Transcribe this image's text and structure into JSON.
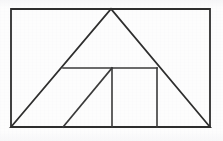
{
  "figure": {
    "background_color": "#fdfdfd",
    "stroke_color": "#2e2e2e",
    "stroke_width": 1.8,
    "canvas": {
      "width": 223,
      "height": 141
    }
  },
  "geometry": {
    "points": {
      "rect_top_left": {
        "label": "rectangle top-left",
        "x": 11,
        "y": 9
      },
      "rect_top_right": {
        "label": "rectangle top-right",
        "x": 210,
        "y": 9
      },
      "rect_bottom_right": {
        "label": "rectangle bottom-right",
        "x": 210,
        "y": 127
      },
      "rect_bottom_left": {
        "label": "rectangle bottom-left",
        "x": 11,
        "y": 127
      },
      "triangle_apex": {
        "label": "large triangle apex",
        "x": 111,
        "y": 9
      },
      "horiz_left": {
        "label": "horizontal segment left end",
        "x": 63,
        "y": 68
      },
      "horiz_right": {
        "label": "horizontal segment right end",
        "x": 157,
        "y": 68
      },
      "vert_mid_top": {
        "label": "middle vertical top",
        "x": 112,
        "y": 68
      },
      "vert_mid_bottom": {
        "label": "middle vertical bottom",
        "x": 112,
        "y": 127
      },
      "vert_right_top": {
        "label": "right vertical top",
        "x": 157,
        "y": 68
      },
      "vert_right_bottom": {
        "label": "right vertical bottom",
        "x": 157,
        "y": 127
      },
      "inner_diag_bottom": {
        "label": "inner diagonal base point",
        "x": 63,
        "y": 127
      }
    },
    "shapes": [
      {
        "name": "outer-rectangle",
        "kind": "rectangle",
        "points": "11,9 210,9 210,127 11,127"
      },
      {
        "name": "large-triangle",
        "kind": "triangle",
        "points": "11,127 111,9 210,127"
      },
      {
        "name": "horizontal-crossbar",
        "kind": "line",
        "points": "63,68 157,68"
      },
      {
        "name": "middle-vertical",
        "kind": "line",
        "points": "112,68 112,127"
      },
      {
        "name": "right-vertical",
        "kind": "line",
        "points": "157,68 157,127"
      },
      {
        "name": "inner-diagonal",
        "kind": "line",
        "points": "63,127 112,68"
      }
    ]
  }
}
